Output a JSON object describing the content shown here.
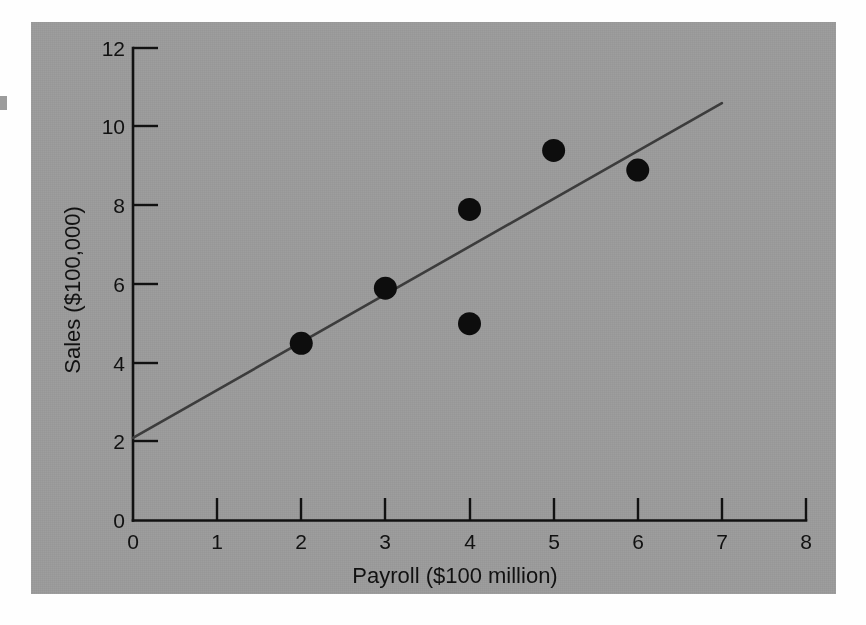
{
  "figure": {
    "background_color": "#9a9a9a",
    "page_color": "#fefefe",
    "point_color": "#0d0d0d",
    "line_color": "#3c3c3c",
    "axis_color": "#111111"
  },
  "chart_data": {
    "type": "scatter",
    "title": "",
    "subtitle": "",
    "xlabel": "Payroll ($100 million)",
    "ylabel": "Sales ($100,000)",
    "xlim": [
      0,
      8
    ],
    "ylim": [
      0,
      12
    ],
    "grid": false,
    "legend": null,
    "legend_position": "none",
    "xticks": [
      0,
      1,
      2,
      3,
      4,
      5,
      6,
      7,
      8
    ],
    "xticklabels": [
      "0",
      "1",
      "2",
      "3",
      "4",
      "5",
      "6",
      "7",
      "8"
    ],
    "yticks": [
      0,
      2,
      4,
      6,
      8,
      10,
      12
    ],
    "yticklabels": [
      "0",
      "2",
      "4",
      "6",
      "8",
      "10",
      "12"
    ],
    "points": [
      {
        "x": 2,
        "y": 4.5
      },
      {
        "x": 3,
        "y": 5.9
      },
      {
        "x": 4,
        "y": 7.9
      },
      {
        "x": 4,
        "y": 5.0
      },
      {
        "x": 5,
        "y": 9.4
      },
      {
        "x": 6,
        "y": 8.9
      }
    ],
    "series": [
      {
        "name": "Sales vs Payroll",
        "type": "scatter",
        "x": [
          2,
          3,
          4,
          4,
          5,
          6
        ],
        "values": [
          4.5,
          5.9,
          7.9,
          5.0,
          9.4,
          8.9
        ]
      },
      {
        "name": "Regression line",
        "type": "line",
        "x": [
          0,
          7
        ],
        "values": [
          2.1,
          10.6
        ],
        "intercept": 2.1,
        "slope": 1.21
      }
    ],
    "annotations": []
  }
}
